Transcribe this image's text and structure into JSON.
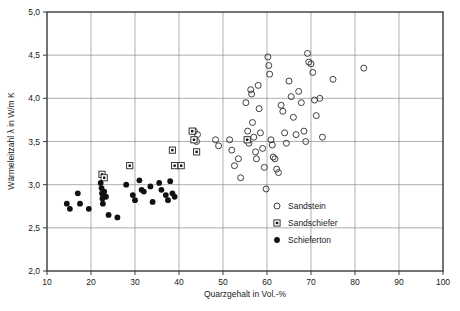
{
  "chart_data": {
    "type": "scatter",
    "title": "",
    "xlabel": "Quarzgehalt in Vol.-%",
    "ylabel": "Wärmeleitzahl λ in W/m K",
    "xlim": [
      10,
      100
    ],
    "ylim": [
      2.0,
      5.0
    ],
    "xticks": [
      "10",
      "20",
      "30",
      "40",
      "50",
      "60",
      "70",
      "80",
      "90",
      "100"
    ],
    "xtick_values": [
      10,
      20,
      30,
      40,
      50,
      60,
      70,
      80,
      90,
      100
    ],
    "yticks": [
      "2,0",
      "2,5",
      "3,0",
      "3,5",
      "4,0",
      "4,5",
      "5,0"
    ],
    "ytick_values": [
      2.0,
      2.5,
      3.0,
      3.5,
      4.0,
      4.5,
      5.0
    ],
    "grid": true,
    "legend_position": "inside-lower-right",
    "series": [
      {
        "name": "Sandstein",
        "marker": "open-circle",
        "color": "#2b2b2b",
        "points": [
          [
            43.5,
            3.62
          ],
          [
            44.2,
            3.58
          ],
          [
            44.0,
            3.5
          ],
          [
            48.3,
            3.52
          ],
          [
            49.0,
            3.45
          ],
          [
            51.5,
            3.52
          ],
          [
            52.0,
            3.4
          ],
          [
            52.6,
            3.22
          ],
          [
            53.5,
            3.3
          ],
          [
            54.0,
            3.08
          ],
          [
            55.2,
            3.95
          ],
          [
            55.6,
            3.62
          ],
          [
            55.9,
            3.48
          ],
          [
            56.3,
            4.1
          ],
          [
            56.5,
            4.05
          ],
          [
            56.7,
            3.72
          ],
          [
            57.0,
            3.55
          ],
          [
            57.4,
            3.38
          ],
          [
            57.6,
            3.3
          ],
          [
            58.0,
            4.15
          ],
          [
            58.2,
            3.88
          ],
          [
            58.5,
            3.6
          ],
          [
            59.0,
            3.42
          ],
          [
            59.4,
            3.2
          ],
          [
            59.8,
            2.95
          ],
          [
            60.2,
            4.48
          ],
          [
            60.4,
            4.38
          ],
          [
            60.6,
            4.28
          ],
          [
            60.9,
            3.52
          ],
          [
            61.2,
            3.46
          ],
          [
            61.4,
            3.32
          ],
          [
            61.8,
            3.3
          ],
          [
            62.2,
            3.18
          ],
          [
            62.6,
            3.14
          ],
          [
            63.2,
            3.92
          ],
          [
            63.6,
            3.85
          ],
          [
            64.0,
            3.6
          ],
          [
            64.4,
            3.48
          ],
          [
            65.0,
            4.2
          ],
          [
            65.5,
            4.02
          ],
          [
            66.0,
            3.78
          ],
          [
            66.6,
            3.58
          ],
          [
            67.2,
            4.08
          ],
          [
            67.8,
            3.95
          ],
          [
            68.4,
            3.62
          ],
          [
            68.8,
            3.5
          ],
          [
            69.2,
            4.52
          ],
          [
            69.5,
            4.42
          ],
          [
            70.0,
            4.4
          ],
          [
            70.4,
            4.3
          ],
          [
            70.8,
            3.98
          ],
          [
            71.2,
            3.8
          ],
          [
            72.0,
            4.0
          ],
          [
            72.6,
            3.55
          ],
          [
            75.0,
            4.22
          ],
          [
            82.0,
            4.35
          ]
        ]
      },
      {
        "name": "Sandschiefer",
        "marker": "dotted-square",
        "color": "#222222",
        "points": [
          [
            22.5,
            3.12
          ],
          [
            23.0,
            3.08
          ],
          [
            28.8,
            3.22
          ],
          [
            38.5,
            3.4
          ],
          [
            39.0,
            3.22
          ],
          [
            40.5,
            3.22
          ],
          [
            43.0,
            3.62
          ],
          [
            43.4,
            3.52
          ],
          [
            44.0,
            3.38
          ],
          [
            55.5,
            3.52
          ]
        ]
      },
      {
        "name": "Schieferton",
        "marker": "filled-circle",
        "color": "#111111",
        "points": [
          [
            14.5,
            2.78
          ],
          [
            15.2,
            2.72
          ],
          [
            17.0,
            2.9
          ],
          [
            17.5,
            2.78
          ],
          [
            19.5,
            2.72
          ],
          [
            22.2,
            3.02
          ],
          [
            22.4,
            2.96
          ],
          [
            22.5,
            2.9
          ],
          [
            22.6,
            2.84
          ],
          [
            22.7,
            2.78
          ],
          [
            23.0,
            2.92
          ],
          [
            23.4,
            2.86
          ],
          [
            24.0,
            2.65
          ],
          [
            26.0,
            2.62
          ],
          [
            28.0,
            3.0
          ],
          [
            29.5,
            2.88
          ],
          [
            30.0,
            2.82
          ],
          [
            31.0,
            3.05
          ],
          [
            31.5,
            2.94
          ],
          [
            32.0,
            2.92
          ],
          [
            33.5,
            2.98
          ],
          [
            34.0,
            2.8
          ],
          [
            35.5,
            3.02
          ],
          [
            36.0,
            2.94
          ],
          [
            37.0,
            2.88
          ],
          [
            37.5,
            2.82
          ],
          [
            38.0,
            3.04
          ],
          [
            38.5,
            2.9
          ],
          [
            39.0,
            2.86
          ]
        ]
      }
    ]
  },
  "legend": {
    "items": [
      {
        "label": "Sandstein",
        "marker": "open-circle"
      },
      {
        "label": "Sandschiefer",
        "marker": "dotted-square"
      },
      {
        "label": "Schieferton",
        "marker": "filled-circle"
      }
    ]
  }
}
